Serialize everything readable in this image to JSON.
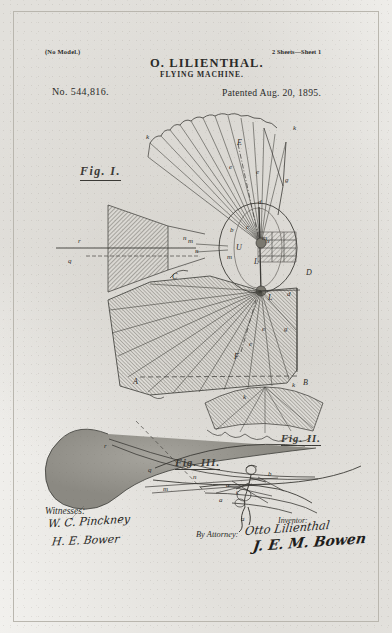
{
  "document": {
    "type": "United States Patent drawing sheet",
    "no_model": "(No Model.)",
    "sheets": "2 Sheets—Sheet 1",
    "inventor_name_heading": "O. LILIENTHAL.",
    "title_heading": "FLYING MACHINE.",
    "patent_number": "No. 544,816.",
    "patent_date": "Patented Aug. 20, 1895."
  },
  "figures": {
    "fig1": {
      "caption": "Fig. I."
    },
    "fig2": {
      "caption": "Fig. II."
    },
    "fig3": {
      "caption": "Fig. III."
    }
  },
  "reference_letters": {
    "fig1": [
      {
        "id": "k-left",
        "label": "k",
        "x": 146,
        "y": 133
      },
      {
        "id": "E-top",
        "label": "E",
        "x": 237,
        "y": 138
      },
      {
        "id": "e-upper",
        "label": "e",
        "x": 229,
        "y": 163
      },
      {
        "id": "e-upper2",
        "label": "e",
        "x": 256,
        "y": 168
      },
      {
        "id": "k-right",
        "label": "k",
        "x": 293,
        "y": 124
      },
      {
        "id": "g-upper",
        "label": "g",
        "x": 285,
        "y": 176
      },
      {
        "id": "d-upper",
        "label": "d",
        "x": 258,
        "y": 198
      },
      {
        "id": "r-tail",
        "label": "r",
        "x": 78,
        "y": 237
      },
      {
        "id": "q-tail",
        "label": "q",
        "x": 68,
        "y": 257
      },
      {
        "id": "n-left",
        "label": "n",
        "x": 183,
        "y": 234
      },
      {
        "id": "m-left",
        "label": "m",
        "x": 188,
        "y": 237
      },
      {
        "id": "b-hub",
        "label": "b",
        "x": 230,
        "y": 226
      },
      {
        "id": "c-hub",
        "label": "c",
        "x": 246,
        "y": 223
      },
      {
        "id": "U-hub",
        "label": "U",
        "x": 236,
        "y": 243
      },
      {
        "id": "m-hub",
        "label": "m",
        "x": 262,
        "y": 234
      },
      {
        "id": "n-hub",
        "label": "n",
        "x": 266,
        "y": 237
      },
      {
        "id": "m-low",
        "label": "m",
        "x": 227,
        "y": 253
      },
      {
        "id": "L-hub",
        "label": "L",
        "x": 254,
        "y": 257
      },
      {
        "id": "n-low",
        "label": "n",
        "x": 195,
        "y": 247
      },
      {
        "id": "C-mid",
        "label": "C",
        "x": 172,
        "y": 272
      },
      {
        "id": "D-right",
        "label": "D",
        "x": 306,
        "y": 268
      },
      {
        "id": "d-mid",
        "label": "d",
        "x": 287,
        "y": 290
      },
      {
        "id": "L-mid",
        "label": "L",
        "x": 268,
        "y": 293
      },
      {
        "id": "e-low",
        "label": "e",
        "x": 262,
        "y": 325
      },
      {
        "id": "e-low2",
        "label": "e",
        "x": 249,
        "y": 340
      },
      {
        "id": "g-low",
        "label": "g",
        "x": 284,
        "y": 325
      },
      {
        "id": "F-low",
        "label": "F",
        "x": 234,
        "y": 352
      },
      {
        "id": "A-base",
        "label": "A",
        "x": 133,
        "y": 377
      },
      {
        "id": "B-base",
        "label": "B",
        "x": 303,
        "y": 378
      },
      {
        "id": "k-base",
        "label": "k",
        "x": 292,
        "y": 381
      },
      {
        "id": "k-base2",
        "label": "k",
        "x": 243,
        "y": 393
      }
    ],
    "fig2": [
      {
        "id": "r-f2",
        "label": "r",
        "x": 104,
        "y": 442
      },
      {
        "id": "q-f2",
        "label": "q",
        "x": 148,
        "y": 466
      },
      {
        "id": "n-f2",
        "label": "n",
        "x": 193,
        "y": 473
      },
      {
        "id": "m-f2",
        "label": "m",
        "x": 163,
        "y": 485
      }
    ],
    "fig3": [
      {
        "id": "b-f3",
        "label": "b",
        "x": 268,
        "y": 470
      },
      {
        "id": "a-f3",
        "label": "a",
        "x": 226,
        "y": 481
      },
      {
        "id": "c-f3",
        "label": "c",
        "x": 236,
        "y": 488
      },
      {
        "id": "a-f3b",
        "label": "a",
        "x": 219,
        "y": 496
      },
      {
        "id": "a-f3c",
        "label": "a",
        "x": 241,
        "y": 515
      }
    ]
  },
  "signature_block": {
    "witnesses_label": "Witnesses:",
    "witness_1": "W. C. Pinckney",
    "witness_2": "H. E. Bower",
    "inventor_label": "Inventor:",
    "inventor_signature": "Otto Lilienthal",
    "attorney_label": "By Attorney:",
    "attorney_signature": "J. E. M. Bowen"
  },
  "colors": {
    "paper": "#f3f2ef",
    "ink": "#3b3a36",
    "border": "#b9b6ae",
    "hatch": "#6f6d67"
  }
}
